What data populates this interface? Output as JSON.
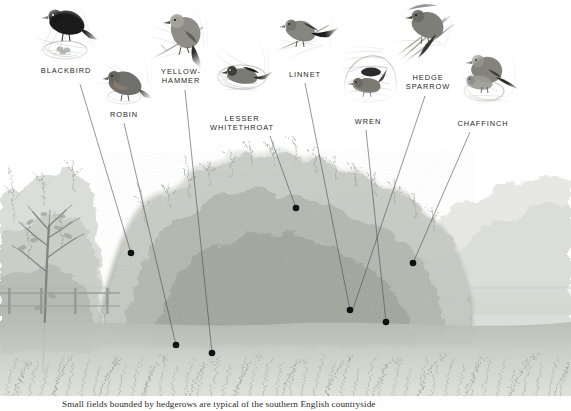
{
  "plate": {
    "title": "Hedgerow birds",
    "width": 571,
    "height": 411,
    "background": "#ffffff",
    "line_color": "#4a4a4a",
    "dot_color": "#111111",
    "label_color": "#262626"
  },
  "caption": {
    "text": "Small fields bounded by hedgerows are typical of the southern English countryside"
  },
  "birds": [
    {
      "id": "blackbird",
      "label": "BLACKBIRD",
      "vignette": {
        "cx": 65,
        "cy": 34,
        "r": 36
      },
      "label_pos": {
        "x": 66,
        "y": 67
      },
      "dot": {
        "x": 131,
        "y": 253
      },
      "line_from": {
        "x": 80,
        "y": 84
      }
    },
    {
      "id": "robin",
      "label": "ROBIN",
      "vignette": {
        "cx": 126,
        "cy": 81,
        "r": 32
      },
      "label_pos": {
        "x": 124,
        "y": 111
      },
      "dot": {
        "x": 176,
        "y": 345
      },
      "line_from": {
        "x": 124,
        "y": 123
      }
    },
    {
      "id": "yellowhammer",
      "label": "YELLOW-\nHAMMER",
      "vignette": {
        "cx": 181,
        "cy": 37,
        "r": 36
      },
      "label_pos": {
        "x": 181,
        "y": 68
      },
      "dot": {
        "x": 212,
        "y": 353
      },
      "line_from": {
        "x": 185,
        "y": 90
      }
    },
    {
      "id": "lesser-whitethroat",
      "label": "LESSER\nWHITETHROAT",
      "vignette": {
        "cx": 242,
        "cy": 68,
        "r": 35
      },
      "label_pos": {
        "x": 242,
        "y": 115
      },
      "dot": {
        "x": 296,
        "y": 208
      },
      "line_from": {
        "x": 270,
        "y": 136
      }
    },
    {
      "id": "linnet",
      "label": "LINNET",
      "vignette": {
        "cx": 306,
        "cy": 34,
        "r": 35
      },
      "label_pos": {
        "x": 305,
        "y": 71
      },
      "dot": {
        "x": 350,
        "y": 310
      },
      "line_from": {
        "x": 305,
        "y": 83
      }
    },
    {
      "id": "wren",
      "label": "WREN",
      "vignette": {
        "cx": 370,
        "cy": 72,
        "r": 34
      },
      "label_pos": {
        "x": 368,
        "y": 118
      },
      "dot": {
        "x": 386,
        "y": 322
      },
      "line_from": {
        "x": 366,
        "y": 130
      }
    },
    {
      "id": "hedge-sparrow",
      "label": "HEDGE\nSPARROW",
      "vignette": {
        "cx": 424,
        "cy": 32,
        "r": 36
      },
      "label_pos": {
        "x": 428,
        "y": 74
      },
      "dot": {
        "x": 350,
        "y": 310
      },
      "line_from": {
        "x": 425,
        "y": 96
      }
    },
    {
      "id": "chaffinch",
      "label": "CHAFFINCH",
      "vignette": {
        "cx": 489,
        "cy": 78,
        "r": 35
      },
      "label_pos": {
        "x": 483,
        "y": 120
      },
      "dot": {
        "x": 413,
        "y": 263
      },
      "line_from": {
        "x": 470,
        "y": 132
      }
    }
  ],
  "scene": {
    "description": "Pencil-and-wash hedgerow landscape: dense central hedge, bare tree and post-and-rail fence at left, grassy verge foreground, distant hedges at right",
    "horizon_y": 300,
    "hedge_top_y": 160,
    "grass_top_y": 360,
    "tones": {
      "sky": "#ffffff",
      "foliage_light": "#d9dcd7",
      "foliage_mid": "#b7bcb5",
      "foliage_dark": "#8d938c",
      "grass": "#c9ccc4",
      "trunk": "#7d7f79"
    }
  }
}
